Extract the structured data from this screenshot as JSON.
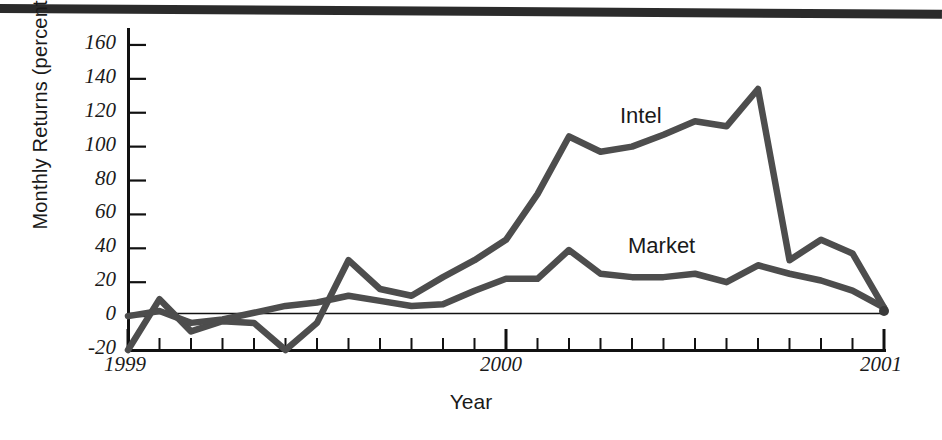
{
  "figure": {
    "background": "#ffffff",
    "line_color": "#4d4d4d",
    "axis_color": "#111111"
  },
  "axes": {
    "ylabel": "Monthly Returns (percent)",
    "xlabel": "Year",
    "y_ticks": [
      160,
      140,
      120,
      100,
      80,
      60,
      40,
      20,
      0,
      -20
    ],
    "x_ticks": [
      "1999",
      "2000",
      "2001"
    ]
  },
  "labels": {
    "intel": "Intel",
    "market": "Market"
  },
  "chart_data": {
    "type": "line",
    "title": "",
    "xlabel": "Year",
    "ylabel": "Monthly Returns (percent)",
    "xlim": [
      0,
      24
    ],
    "ylim": [
      -20,
      170
    ],
    "ytick_values": [
      160,
      140,
      120,
      100,
      80,
      60,
      40,
      20,
      0,
      -20
    ],
    "xtick_values": [
      0,
      12,
      24
    ],
    "xtick_labels": [
      "1999",
      "2000",
      "2001"
    ],
    "minor_x_ticks_per_year": 12,
    "grid": false,
    "zero_line": true,
    "legend": "inline-annotations",
    "x": [
      0,
      1,
      2,
      3,
      4,
      5,
      6,
      7,
      8,
      9,
      10,
      11,
      12,
      13,
      14,
      15,
      16,
      17,
      18,
      19,
      20,
      21,
      22,
      23,
      24
    ],
    "series": [
      {
        "name": "Intel",
        "color": "#4d4d4d",
        "values": [
          -20,
          10,
          -9,
          -3,
          -4,
          -20,
          -4,
          33,
          16,
          12,
          23,
          33,
          45,
          72,
          106,
          97,
          100,
          107,
          115,
          112,
          134,
          33,
          45,
          37,
          5
        ]
      },
      {
        "name": "Market",
        "color": "#4d4d4d",
        "values": [
          0,
          3,
          -4,
          -2,
          2,
          6,
          8,
          12,
          9,
          6,
          7,
          15,
          22,
          22,
          39,
          25,
          23,
          23,
          25,
          20,
          30,
          25,
          21,
          15,
          5
        ]
      }
    ]
  }
}
